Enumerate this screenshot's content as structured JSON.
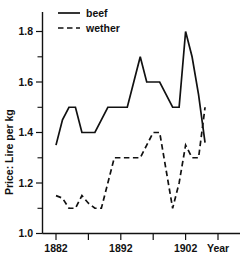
{
  "chart_data": {
    "type": "line",
    "title": "",
    "xlabel": "Year",
    "ylabel": "Price: Lire per kg",
    "xlim": [
      1881,
      1907
    ],
    "ylim": [
      1.0,
      1.85
    ],
    "grid": false,
    "legend_position": "top-left",
    "x_ticks": [
      1882,
      1887,
      1892,
      1897,
      1902,
      1907
    ],
    "x_tick_labels": [
      "1882",
      "",
      "1892",
      "",
      "1902",
      ""
    ],
    "y_ticks": [
      1.0,
      1.1,
      1.2,
      1.3,
      1.4,
      1.5,
      1.6,
      1.7,
      1.8
    ],
    "y_tick_labels": [
      "1.0",
      "",
      "1.2",
      "",
      "1.4",
      "",
      "1.6",
      "",
      "1.8"
    ],
    "x": [
      1882,
      1883,
      1884,
      1885,
      1886,
      1887,
      1888,
      1889,
      1890,
      1891,
      1892,
      1893,
      1894,
      1895,
      1896,
      1897,
      1898,
      1899,
      1900,
      1901,
      1902,
      1903,
      1904,
      1905
    ],
    "series": [
      {
        "name": "beef",
        "style": "solid",
        "color": "#111111",
        "values": [
          1.35,
          1.45,
          1.5,
          1.5,
          1.4,
          1.4,
          1.4,
          1.45,
          1.5,
          1.5,
          1.5,
          1.5,
          1.6,
          1.7,
          1.6,
          1.6,
          1.6,
          1.55,
          1.5,
          1.5,
          1.8,
          1.7,
          1.55,
          1.36
        ]
      },
      {
        "name": "wether",
        "style": "dashed",
        "color": "#111111",
        "values": [
          1.15,
          1.14,
          1.1,
          1.1,
          1.15,
          1.12,
          1.1,
          1.1,
          1.2,
          1.3,
          1.3,
          1.3,
          1.3,
          1.3,
          1.35,
          1.4,
          1.4,
          1.25,
          1.1,
          1.2,
          1.35,
          1.3,
          1.3,
          1.5
        ]
      }
    ],
    "legend": [
      {
        "label": "beef",
        "style": "solid"
      },
      {
        "label": "wether",
        "style": "dashed"
      }
    ]
  }
}
